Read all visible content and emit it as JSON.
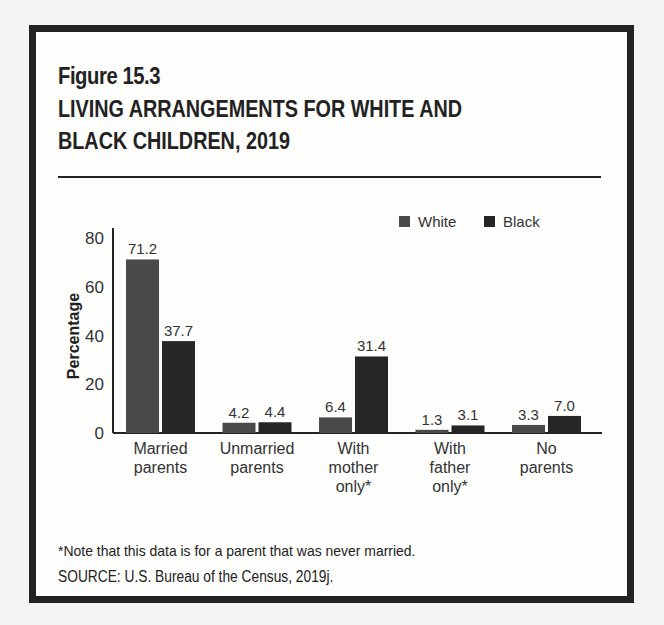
{
  "figure": {
    "number": "Figure 15.3",
    "title_line1": "LIVING ARRANGEMENTS FOR WHITE AND",
    "title_line2": "BLACK CHILDREN, 2019",
    "note": "*Note that this data is for a parent that was never married.",
    "source": "SOURCE: U.S. Bureau of the Census, 2019j."
  },
  "colors": {
    "white_series": "#4a4a4a",
    "black_series": "#262626",
    "text": "#222222"
  },
  "chart_data": {
    "type": "bar",
    "title": "LIVING ARRANGEMENTS FOR WHITE AND BLACK CHILDREN, 2019",
    "xlabel": "",
    "ylabel": "Percentage",
    "ylim": [
      0,
      80
    ],
    "yticks": [
      0,
      20,
      40,
      60,
      80
    ],
    "grid": false,
    "legend_position": "top-right",
    "categories": [
      [
        "Married",
        "parents"
      ],
      [
        "Unmarried",
        "parents"
      ],
      [
        "With",
        "mother",
        "only*"
      ],
      [
        "With",
        "father",
        "only*"
      ],
      [
        "No",
        "parents"
      ]
    ],
    "series": [
      {
        "name": "White",
        "values": [
          71.2,
          4.2,
          6.4,
          1.3,
          3.3
        ],
        "labels": [
          "71.2",
          "4.2",
          "6.4",
          "1.3",
          "3.3"
        ]
      },
      {
        "name": "Black",
        "values": [
          37.7,
          4.4,
          31.4,
          3.1,
          7.0
        ],
        "labels": [
          "37.7",
          "4.4",
          "31.4",
          "3.1",
          "7.0"
        ]
      }
    ]
  }
}
